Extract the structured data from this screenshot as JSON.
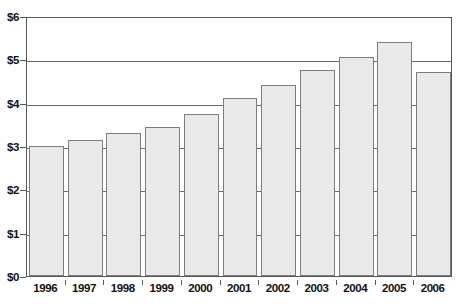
{
  "chart_data": {
    "type": "bar",
    "title": "",
    "xlabel": "",
    "ylabel": "",
    "categories": [
      "1996",
      "1997",
      "1998",
      "1999",
      "2000",
      "2001",
      "2002",
      "2003",
      "2004",
      "2005",
      "2006"
    ],
    "values": [
      3.0,
      3.15,
      3.3,
      3.45,
      3.75,
      4.1,
      4.4,
      4.75,
      5.05,
      5.4,
      4.7
    ],
    "ylim": [
      0,
      6
    ],
    "ytick_values": [
      0,
      1,
      2,
      3,
      4,
      5,
      6
    ],
    "ytick_labels": [
      "$0",
      "$1",
      "$2",
      "$3",
      "$4",
      "$5",
      "$6"
    ],
    "grid": true,
    "grid_axis": "y",
    "legend": null,
    "legend_position": "none",
    "annotations": [],
    "series": [
      {
        "name": "value",
        "values": [
          3.0,
          3.15,
          3.3,
          3.45,
          3.75,
          4.1,
          4.4,
          4.75,
          5.05,
          5.4,
          4.7
        ]
      }
    ],
    "colors": {
      "bar_fill": "#e9e9e9",
      "bar_border": "#7d7d7d",
      "gridline": "#6a6a6a",
      "frame": "#585858",
      "text": "#111111",
      "background": "#ffffff"
    }
  }
}
